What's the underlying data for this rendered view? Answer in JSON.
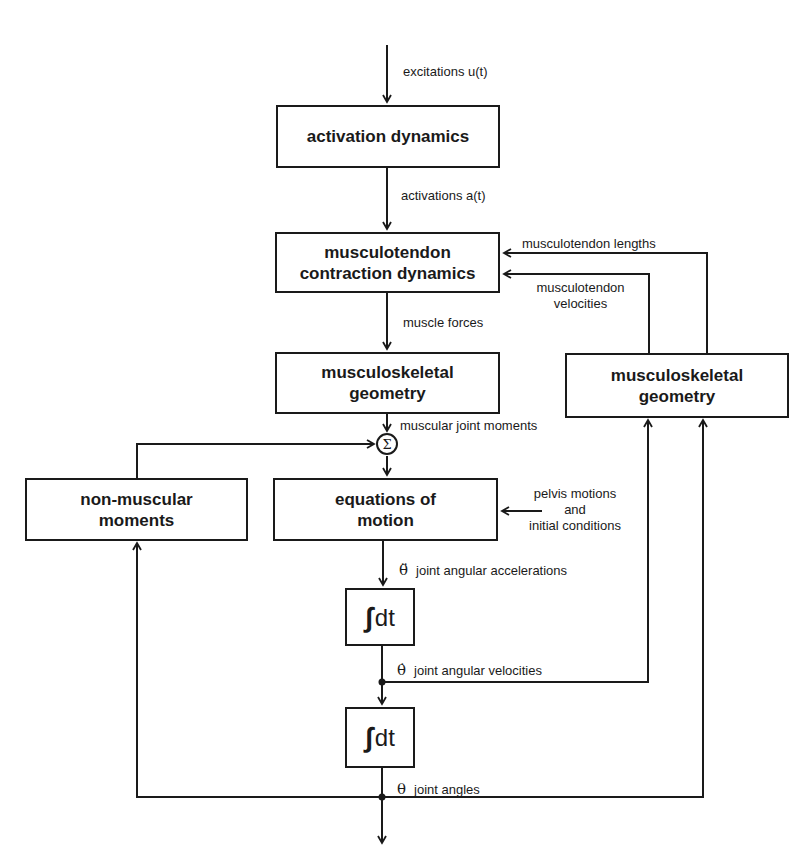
{
  "blocks": {
    "activation_dynamics": "activation dynamics",
    "musculotendon_line1": "musculotendon",
    "musculotendon_line2": "contraction dynamics",
    "msk_geom_left_line1": "musculoskeletal",
    "msk_geom_left_line2": "geometry",
    "msk_geom_right_line1": "musculoskeletal",
    "msk_geom_right_line2": "geometry",
    "non_muscular_line1": "non-muscular",
    "non_muscular_line2": "moments",
    "eom_line1": "equations of",
    "eom_line2": "motion",
    "integrator": "dt",
    "integral_symbol": "∫",
    "sum_symbol": "Σ"
  },
  "signals": {
    "excitations": "excitations u(t)",
    "activations": "activations a(t)",
    "muscle_forces": "muscle forces",
    "musculotendon_lengths": "musculotendon lengths",
    "musculotendon_velocities_line1": "musculotendon",
    "musculotendon_velocities_line2": "velocities",
    "muscular_joint_moments": "muscular joint moments",
    "pelvis_line1": "pelvis motions",
    "pelvis_line2": "and",
    "pelvis_line3": "initial conditions",
    "accel_symbol": "θ̈",
    "accel_label": "joint angular accelerations",
    "vel_symbol": "θ̇",
    "vel_label": "joint angular velocities",
    "angle_symbol": "θ",
    "angle_label": "joint angles"
  },
  "colors": {
    "ink": "#1a1a1a",
    "background": "#ffffff"
  }
}
